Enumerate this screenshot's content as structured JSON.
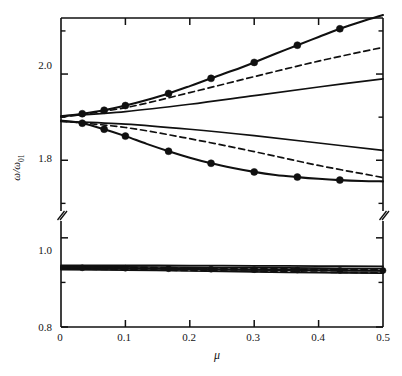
{
  "figure": {
    "background_color": "#ffffff",
    "ink_color": "#101010"
  },
  "axes": {
    "x_label": "μ",
    "y_label": "ω/ω",
    "y_label_subscript": "01",
    "x_ticks": [
      "0",
      "0.1",
      "0.2",
      "0.3",
      "0.4",
      "0.5"
    ],
    "x_tick_values": [
      0,
      0.1,
      0.2,
      0.3,
      0.4,
      0.5
    ],
    "y_ticks_upper": [
      "2.0",
      "1.8"
    ],
    "y_tick_values_upper": [
      2.0,
      1.8
    ],
    "y_ticks_lower": [
      "1.0",
      "0.8"
    ],
    "y_tick_values_lower": [
      1.0,
      0.8
    ],
    "y_minor_ticks_upper": [
      2.1,
      1.9,
      1.7
    ],
    "y_minor_ticks_lower": [
      0.9
    ],
    "axis_break": true,
    "axis_break_label": "//"
  },
  "chart_data": {
    "type": "line",
    "title": "",
    "xlabel": "μ",
    "ylabel": "ω/ω₀₁",
    "xlim": [
      0,
      0.5
    ],
    "ylim_upper": [
      1.68,
      2.13
    ],
    "ylim_lower": [
      0.8,
      1.04
    ],
    "grid": false,
    "legend": "none",
    "broken_y_axis": true,
    "series": [
      {
        "name": "upper-branch-markers",
        "style": "solid",
        "markers": true,
        "panel": "upper",
        "x": [
          0.0,
          0.033,
          0.067,
          0.1,
          0.133,
          0.167,
          0.2,
          0.233,
          0.267,
          0.3,
          0.333,
          0.367,
          0.4,
          0.433,
          0.467,
          0.5
        ],
        "y": [
          1.902,
          1.908,
          1.916,
          1.927,
          1.94,
          1.955,
          1.972,
          1.99,
          2.008,
          2.027,
          2.047,
          2.067,
          2.086,
          2.105,
          2.122,
          2.137
        ]
      },
      {
        "name": "upper-branch-dashed",
        "style": "dashed",
        "markers": false,
        "panel": "upper",
        "x": [
          0.0,
          0.1,
          0.2,
          0.3,
          0.4,
          0.5
        ],
        "y": [
          1.9,
          1.922,
          1.957,
          1.994,
          2.03,
          2.062
        ]
      },
      {
        "name": "upper-branch-solid-plain",
        "style": "solid",
        "markers": false,
        "panel": "upper",
        "x": [
          0.0,
          0.1,
          0.2,
          0.3,
          0.4,
          0.5
        ],
        "y": [
          1.902,
          1.913,
          1.93,
          1.95,
          1.97,
          1.989
        ]
      },
      {
        "name": "lower-branch-solid-plain",
        "style": "solid",
        "markers": false,
        "panel": "upper",
        "x": [
          0.0,
          0.1,
          0.2,
          0.3,
          0.4,
          0.5
        ],
        "y": [
          1.89,
          1.884,
          1.872,
          1.857,
          1.84,
          1.823
        ]
      },
      {
        "name": "lower-branch-dashed",
        "style": "dashed",
        "markers": false,
        "panel": "upper",
        "x": [
          0.0,
          0.1,
          0.2,
          0.3,
          0.4,
          0.5
        ],
        "y": [
          1.891,
          1.876,
          1.85,
          1.82,
          1.788,
          1.76
        ]
      },
      {
        "name": "lower-branch-markers",
        "style": "solid",
        "markers": true,
        "panel": "upper",
        "x": [
          0.0,
          0.033,
          0.067,
          0.1,
          0.133,
          0.167,
          0.2,
          0.233,
          0.267,
          0.3,
          0.333,
          0.367,
          0.4,
          0.433,
          0.467,
          0.5
        ],
        "y": [
          1.892,
          1.886,
          1.872,
          1.856,
          1.838,
          1.821,
          1.806,
          1.793,
          1.782,
          1.773,
          1.766,
          1.761,
          1.757,
          1.754,
          1.752,
          1.751
        ]
      },
      {
        "name": "acoustic-cluster-solid-top",
        "style": "solid",
        "markers": false,
        "panel": "lower",
        "x": [
          0.0,
          0.1,
          0.2,
          0.3,
          0.4,
          0.5
        ],
        "y": [
          0.9385,
          0.9383,
          0.9378,
          0.9372,
          0.9366,
          0.936
        ]
      },
      {
        "name": "acoustic-cluster-solid-upper",
        "style": "solid",
        "markers": false,
        "panel": "lower",
        "x": [
          0.0,
          0.1,
          0.2,
          0.3,
          0.4,
          0.5
        ],
        "y": [
          0.9355,
          0.935,
          0.934,
          0.933,
          0.932,
          0.9312
        ]
      },
      {
        "name": "acoustic-cluster-dashed-upper",
        "style": "dashed",
        "markers": false,
        "panel": "lower",
        "x": [
          0.0,
          0.1,
          0.2,
          0.3,
          0.4,
          0.5
        ],
        "y": [
          0.9348,
          0.934,
          0.9326,
          0.931,
          0.9296,
          0.9284
        ]
      },
      {
        "name": "acoustic-cluster-markers",
        "style": "solid",
        "markers": true,
        "panel": "lower",
        "x": [
          0.0,
          0.033,
          0.067,
          0.1,
          0.133,
          0.167,
          0.2,
          0.233,
          0.267,
          0.3,
          0.333,
          0.367,
          0.4,
          0.433,
          0.467,
          0.5
        ],
        "y": [
          0.933,
          0.9327,
          0.9323,
          0.9318,
          0.9313,
          0.9308,
          0.9302,
          0.9297,
          0.9291,
          0.9286,
          0.9281,
          0.9277,
          0.9273,
          0.927,
          0.9268,
          0.9266
        ]
      },
      {
        "name": "acoustic-cluster-solid-lower",
        "style": "solid",
        "markers": false,
        "panel": "lower",
        "x": [
          0.0,
          0.1,
          0.2,
          0.3,
          0.4,
          0.5
        ],
        "y": [
          0.9318,
          0.931,
          0.9296,
          0.9282,
          0.927,
          0.926
        ]
      },
      {
        "name": "acoustic-cluster-dashed-lower",
        "style": "dashed",
        "markers": false,
        "panel": "lower",
        "x": [
          0.0,
          0.1,
          0.2,
          0.3,
          0.4,
          0.5
        ],
        "y": [
          0.93,
          0.9288,
          0.9268,
          0.9248,
          0.923,
          0.9216
        ]
      },
      {
        "name": "acoustic-cluster-solid-bottom",
        "style": "solid",
        "markers": false,
        "panel": "lower",
        "x": [
          0.0,
          0.1,
          0.2,
          0.3,
          0.4,
          0.5
        ],
        "y": [
          0.9288,
          0.9276,
          0.9256,
          0.9236,
          0.922,
          0.9208
        ]
      }
    ]
  }
}
